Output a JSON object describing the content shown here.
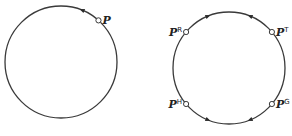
{
  "figure": {
    "left_panel": {
      "circle": {
        "cx": 61,
        "cy": 62,
        "r": 56
      },
      "points": [
        {
          "label": "P",
          "superscript": "",
          "angle_deg": -48
        }
      ],
      "arrows": [
        {
          "angle_deg": -68,
          "direction": "counterclockwise"
        }
      ]
    },
    "right_panel": {
      "circle": {
        "cx": 229,
        "cy": 68,
        "r": 56
      },
      "points": [
        {
          "label": "P",
          "superscript": "R",
          "angle_deg": -140
        },
        {
          "label": "P",
          "superscript": "T",
          "angle_deg": -40
        },
        {
          "label": "P",
          "superscript": "H",
          "angle_deg": 140
        },
        {
          "label": "P",
          "superscript": "G",
          "angle_deg": 40
        }
      ],
      "arrows": [
        {
          "angle_deg": -112,
          "direction": "clockwise"
        },
        {
          "angle_deg": -68,
          "direction": "counterclockwise"
        },
        {
          "angle_deg": 112,
          "direction": "counterclockwise"
        },
        {
          "angle_deg": 68,
          "direction": "clockwise"
        }
      ]
    }
  }
}
